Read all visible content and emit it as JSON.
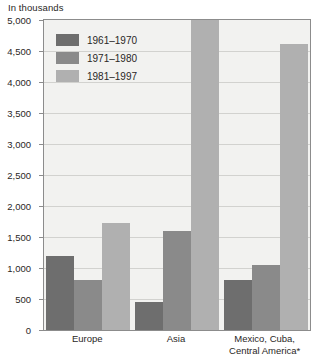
{
  "axis_caption": "In thousands",
  "legend": {
    "items": [
      {
        "label": "1961–1970",
        "color": "#6e6e6e"
      },
      {
        "label": "1971–1980",
        "color": "#8a8a8a"
      },
      {
        "label": "1981–1997",
        "color": "#b0b0b0"
      }
    ]
  },
  "y_axis": {
    "ticks": [
      "5,000",
      "4,500",
      "4,000",
      "3,500",
      "3,000",
      "2,500",
      "2,000",
      "1,500",
      "1,000",
      "500",
      "0"
    ]
  },
  "chart_data": {
    "type": "bar",
    "title": "",
    "subtitle": "",
    "xlabel": "",
    "ylabel": "In thousands",
    "ylim": [
      0,
      5000
    ],
    "ytick_step": 500,
    "grid": true,
    "legend_position": "inside-top-left",
    "categories": [
      "Europe",
      "Asia",
      "Mexico, Cuba,\nCentral America*"
    ],
    "series": [
      {
        "name": "1961–1970",
        "color": "#6e6e6e",
        "values": [
          1200,
          450,
          800
        ]
      },
      {
        "name": "1971–1980",
        "color": "#8a8a8a",
        "values": [
          800,
          1600,
          1050
        ]
      },
      {
        "name": "1981–1997",
        "color": "#b0b0b0",
        "values": [
          1730,
          5000,
          4620
        ]
      }
    ],
    "annotations": [
      "* Asia 1981–1997 bar reaches the top of the plot area"
    ]
  },
  "style": {
    "plot_background": "#f2f2f0",
    "gridline_color": "#d2d2cf",
    "axis_color": "#8c8c8c",
    "text_color": "#2a2726"
  }
}
